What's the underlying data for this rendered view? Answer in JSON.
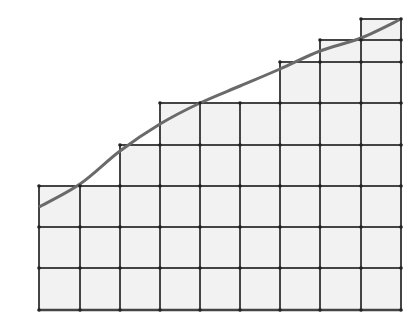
{
  "diagram": {
    "type": "riemann-upper-sum-grid",
    "colors": {
      "background": "#ffffff",
      "fill": "#f2f2f2",
      "grid_line": "#444444",
      "curve": "#6a6a6a",
      "vertex": "#222222"
    },
    "grid": {
      "x_lines": [
        39,
        80,
        120,
        160,
        200,
        240,
        280,
        320,
        361,
        401
      ],
      "baseline_y": 310,
      "unit": 41
    },
    "columns": [
      {
        "x0": 39,
        "x1": 80,
        "top": 186
      },
      {
        "x0": 80,
        "x1": 120,
        "top": 186
      },
      {
        "x0": 120,
        "x1": 160,
        "top": 145
      },
      {
        "x0": 160,
        "x1": 200,
        "top": 103
      },
      {
        "x0": 200,
        "x1": 240,
        "top": 103
      },
      {
        "x0": 240,
        "x1": 280,
        "top": 103
      },
      {
        "x0": 280,
        "x1": 320,
        "top": 62
      },
      {
        "x0": 320,
        "x1": 361,
        "top": 40
      },
      {
        "x0": 361,
        "x1": 401,
        "top": 19
      }
    ],
    "h_lines": [
      {
        "y": 186,
        "x0": 39,
        "x1": 401
      },
      {
        "y": 227,
        "x0": 39,
        "x1": 401
      },
      {
        "y": 268,
        "x0": 39,
        "x1": 401
      },
      {
        "y": 145,
        "x0": 120,
        "x1": 401
      },
      {
        "y": 103,
        "x0": 160,
        "x1": 401
      },
      {
        "y": 62,
        "x0": 280,
        "x1": 401
      },
      {
        "y": 40,
        "x0": 320,
        "x1": 401
      },
      {
        "y": 19,
        "x0": 361,
        "x1": 401
      }
    ],
    "curve_points": [
      [
        39,
        207
      ],
      [
        80,
        184
      ],
      [
        120,
        151
      ],
      [
        160,
        124
      ],
      [
        200,
        103
      ],
      [
        240,
        86
      ],
      [
        280,
        69
      ],
      [
        320,
        51
      ],
      [
        361,
        38
      ],
      [
        401,
        19
      ]
    ]
  }
}
